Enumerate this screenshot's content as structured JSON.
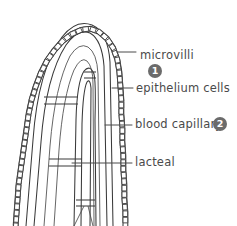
{
  "figure": {
    "background_color": "#ffffff",
    "ink_color": "#3a3a3a",
    "text_color": "#4a4a4a",
    "badge_color": "#6b6b6b",
    "badge_text_color": "#ffffff"
  },
  "labels": [
    {
      "id": "microvilli",
      "text": "microvilli",
      "x": 140,
      "y": 50,
      "leader": {
        "x1": 117,
        "y1": 52,
        "x2": 136,
        "y2": 52
      }
    },
    {
      "id": "epithelium-cells",
      "text": "epithelium cells",
      "x": 136,
      "y": 83,
      "leader": {
        "x1": 112,
        "y1": 88,
        "x2": 133,
        "y2": 88
      }
    },
    {
      "id": "blood-capillary",
      "text": "blood capillary",
      "x": 135,
      "y": 119,
      "leader": {
        "x1": 105,
        "y1": 125,
        "x2": 132,
        "y2": 125
      }
    },
    {
      "id": "lacteal",
      "text": "lacteal",
      "x": 135,
      "y": 157,
      "leader": {
        "x1": 72,
        "y1": 163,
        "x2": 132,
        "y2": 163
      }
    }
  ],
  "badges": [
    {
      "id": "badge-1",
      "number": "1",
      "x": 148,
      "y": 64
    },
    {
      "id": "badge-2",
      "number": "2",
      "x": 213,
      "y": 117
    }
  ]
}
